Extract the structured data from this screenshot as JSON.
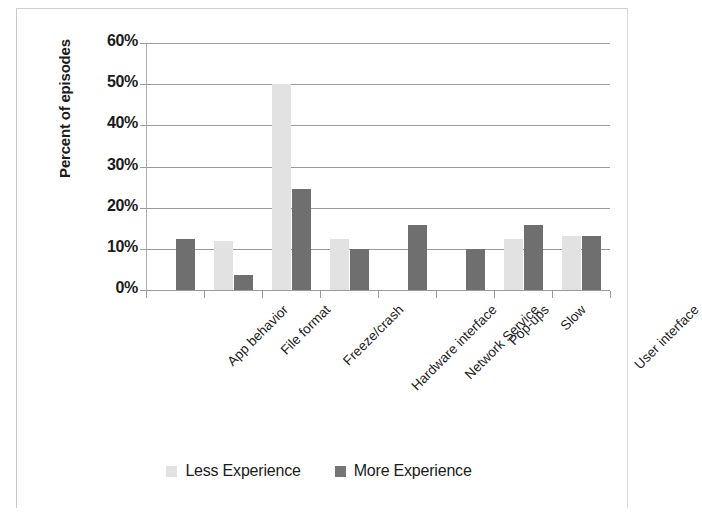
{
  "chart_data": {
    "type": "bar",
    "title": "",
    "xlabel": "",
    "ylabel": "Percent of episodes",
    "ylim": [
      0,
      60
    ],
    "ytick_labels": [
      "60%",
      "50%",
      "40%",
      "30%",
      "20%",
      "10%",
      "0%"
    ],
    "ytick_values": [
      60,
      50,
      40,
      30,
      20,
      10,
      0
    ],
    "grid": true,
    "legend_position": "bottom",
    "categories": [
      "App behavior",
      "File format",
      "Freeze/crash",
      "Hardware interface",
      "Network Service",
      "Pop-ups",
      "Slow",
      "User interface"
    ],
    "series": [
      {
        "name": "Less Experience",
        "color": "#e2e2e2",
        "values": [
          null,
          12.0,
          50.0,
          12.5,
          null,
          null,
          12.5,
          13.0
        ]
      },
      {
        "name": "More Experience",
        "color": "#6f6f6f",
        "values": [
          12.5,
          3.7,
          24.5,
          10.0,
          15.7,
          10.0,
          15.7,
          13.0
        ]
      }
    ]
  },
  "legend": {
    "items": [
      {
        "label": "Less Experience",
        "swatch": "less"
      },
      {
        "label": "More Experience",
        "swatch": "more"
      }
    ]
  }
}
